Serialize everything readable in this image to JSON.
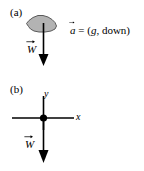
{
  "figure": {
    "background_color": "#ffffff",
    "ink_color": "#000000",
    "blob_fill_color": "#b3b3b3",
    "blob_stroke_color": "#4d4d4d"
  },
  "panel_a": {
    "label": "(a)",
    "object_shape_name": "irregular-blob",
    "weight_vector_label": "W",
    "weight_vector_direction": "down",
    "equation": {
      "vector_symbol": "a",
      "equals": " = (",
      "magnitude": "g",
      "separator": ", ",
      "direction": "down",
      "close": ")"
    }
  },
  "panel_b": {
    "label": "(b)",
    "axis_label_x": "x",
    "axis_label_y": "y",
    "particle_name": "point-mass-dot",
    "weight_vector_label": "W",
    "weight_vector_direction": "down"
  }
}
